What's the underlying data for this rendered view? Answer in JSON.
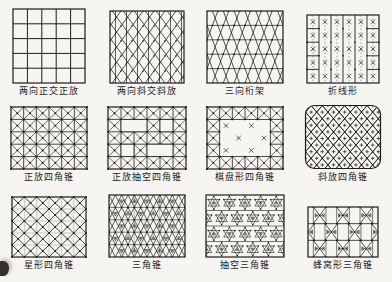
{
  "page": {
    "background": "#f6f5f1",
    "ink": "#1c1c1c"
  },
  "figure": {
    "diagrams": [
      {
        "label": "两向正交正放",
        "pattern": "orthogonal-grid"
      },
      {
        "label": "两向斜交斜放",
        "pattern": "diagonal-lattice"
      },
      {
        "label": "三向桁架",
        "pattern": "three-way-truss"
      },
      {
        "label": "折线形",
        "pattern": "fold-line"
      },
      {
        "label": "正放四角锥",
        "pattern": "square-pyramid"
      },
      {
        "label": "正放抽空四角锥",
        "pattern": "square-pyramid-hollow"
      },
      {
        "label": "棋盘形四角锥",
        "pattern": "checkerboard-pyramid"
      },
      {
        "label": "斜放四角锥",
        "pattern": "diagonal-pyramid"
      },
      {
        "label": "星形四角锥",
        "pattern": "star-pyramid"
      },
      {
        "label": "三角锥",
        "pattern": "triangular-pyramid"
      },
      {
        "label": "抽空三角锥",
        "pattern": "triangular-pyramid-hollow"
      },
      {
        "label": "蜂窝形三角锥",
        "pattern": "honeycomb-pyramid"
      }
    ]
  }
}
